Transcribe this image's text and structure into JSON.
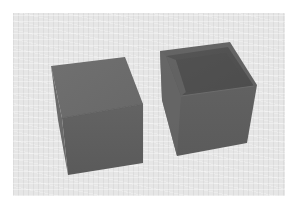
{
  "scene": {
    "description": "Two gray cubes on a light textured ground plane: a solid closed cube on the left and an open-topped hollow box on the right",
    "background_color": "#ffffff",
    "ground_color": "#e6e6e6"
  },
  "objects": [
    {
      "name": "solid-cube",
      "label": "Closed cube",
      "top_face_color": "#6e6e6e",
      "front_face_color": "#5f5f5f"
    },
    {
      "name": "open-box",
      "label": "Open-top box",
      "outer_face_color": "#606060",
      "inner_back_wall_color": "#545454",
      "inner_left_wall_color": "#6a6a6a",
      "inner_floor_color": "#4e4e4e"
    }
  ]
}
